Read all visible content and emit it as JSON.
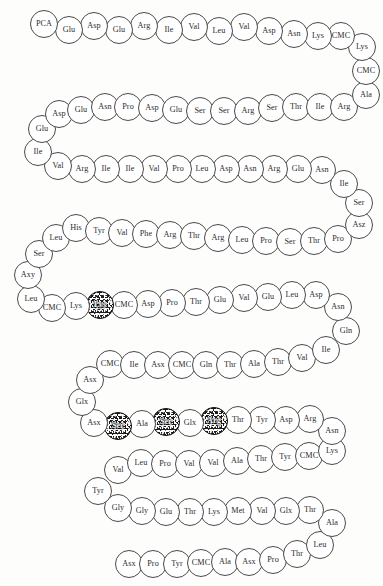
{
  "figure": {
    "caption": "",
    "width": 383,
    "height": 586,
    "circle_diameter": 28,
    "colors": {
      "background": "#fdfdfc",
      "circle_fill": "#ffffff",
      "circle_stroke": "#4a4a4a",
      "modified_fill": "#1c1c1c",
      "text": "#2b2b2b",
      "modified_text": "#ffffff"
    }
  },
  "legend": {
    "modified_meaning": "shaded residue"
  },
  "chart_data": {
    "type": "diagram",
    "title": "",
    "layout": "boustrophedon",
    "modified_positions": [
      59,
      117,
      119,
      121
    ],
    "residues": [
      {
        "i": 1,
        "label": "PCA",
        "x": 30,
        "y": 10,
        "modified": false
      },
      {
        "i": 2,
        "label": "Glu",
        "x": 55,
        "y": 16,
        "modified": false
      },
      {
        "i": 3,
        "label": "Asp",
        "x": 80,
        "y": 12,
        "modified": false
      },
      {
        "i": 4,
        "label": "Glu",
        "x": 105,
        "y": 16,
        "modified": false
      },
      {
        "i": 5,
        "label": "Arg",
        "x": 130,
        "y": 12,
        "modified": false
      },
      {
        "i": 6,
        "label": "Ile",
        "x": 155,
        "y": 16,
        "modified": false
      },
      {
        "i": 7,
        "label": "Val",
        "x": 180,
        "y": 13,
        "modified": false
      },
      {
        "i": 8,
        "label": "Leu",
        "x": 205,
        "y": 17,
        "modified": false
      },
      {
        "i": 9,
        "label": "Val",
        "x": 230,
        "y": 13,
        "modified": false
      },
      {
        "i": 10,
        "label": "Asp",
        "x": 255,
        "y": 17,
        "modified": false
      },
      {
        "i": 11,
        "label": "Asn",
        "x": 280,
        "y": 20,
        "modified": false
      },
      {
        "i": 12,
        "label": "Lys",
        "x": 304,
        "y": 22,
        "modified": false
      },
      {
        "i": 13,
        "label": "CMC",
        "x": 327,
        "y": 22,
        "modified": false
      },
      {
        "i": 14,
        "label": "Lys",
        "x": 348,
        "y": 33,
        "modified": false
      },
      {
        "i": 15,
        "label": "CMC",
        "x": 352,
        "y": 57,
        "modified": false
      },
      {
        "i": 16,
        "label": "Ala",
        "x": 352,
        "y": 81,
        "modified": false
      },
      {
        "i": 17,
        "label": "Arg",
        "x": 330,
        "y": 93,
        "modified": false
      },
      {
        "i": 18,
        "label": "Ile",
        "x": 306,
        "y": 93,
        "modified": false
      },
      {
        "i": 19,
        "label": "Thr",
        "x": 282,
        "y": 93,
        "modified": false
      },
      {
        "i": 20,
        "label": "Ser",
        "x": 258,
        "y": 94,
        "modified": false
      },
      {
        "i": 21,
        "label": "Arg",
        "x": 234,
        "y": 97,
        "modified": false
      },
      {
        "i": 22,
        "label": "Ser",
        "x": 210,
        "y": 97,
        "modified": false
      },
      {
        "i": 23,
        "label": "Ser",
        "x": 186,
        "y": 97,
        "modified": false
      },
      {
        "i": 24,
        "label": "Glu",
        "x": 162,
        "y": 96,
        "modified": false
      },
      {
        "i": 25,
        "label": "Asp",
        "x": 138,
        "y": 94,
        "modified": false
      },
      {
        "i": 26,
        "label": "Pro",
        "x": 114,
        "y": 93,
        "modified": false
      },
      {
        "i": 27,
        "label": "Asn",
        "x": 91,
        "y": 93,
        "modified": false
      },
      {
        "i": 28,
        "label": "Glu",
        "x": 67,
        "y": 96,
        "modified": false
      },
      {
        "i": 29,
        "label": "Asp",
        "x": 45,
        "y": 100,
        "modified": false
      },
      {
        "i": 30,
        "label": "Glu",
        "x": 28,
        "y": 115,
        "modified": false
      },
      {
        "i": 31,
        "label": "Ile",
        "x": 24,
        "y": 138,
        "modified": false
      },
      {
        "i": 32,
        "label": "Val",
        "x": 44,
        "y": 152,
        "modified": false
      },
      {
        "i": 33,
        "label": "Arg",
        "x": 68,
        "y": 155,
        "modified": false
      },
      {
        "i": 34,
        "label": "Ile",
        "x": 92,
        "y": 155,
        "modified": false
      },
      {
        "i": 35,
        "label": "Ile",
        "x": 116,
        "y": 155,
        "modified": false
      },
      {
        "i": 36,
        "label": "Val",
        "x": 140,
        "y": 155,
        "modified": false
      },
      {
        "i": 37,
        "label": "Pro",
        "x": 164,
        "y": 155,
        "modified": false
      },
      {
        "i": 38,
        "label": "Leu",
        "x": 188,
        "y": 155,
        "modified": false
      },
      {
        "i": 39,
        "label": "Asp",
        "x": 212,
        "y": 155,
        "modified": false
      },
      {
        "i": 40,
        "label": "Asn",
        "x": 236,
        "y": 155,
        "modified": false
      },
      {
        "i": 41,
        "label": "Arg",
        "x": 260,
        "y": 155,
        "modified": false
      },
      {
        "i": 42,
        "label": "Glu",
        "x": 284,
        "y": 155,
        "modified": false
      },
      {
        "i": 43,
        "label": "Asn",
        "x": 308,
        "y": 156,
        "modified": false
      },
      {
        "i": 44,
        "label": "Ile",
        "x": 330,
        "y": 170,
        "modified": false
      },
      {
        "i": 45,
        "label": "Ser",
        "x": 345,
        "y": 189,
        "modified": false
      },
      {
        "i": 46,
        "label": "Asz",
        "x": 345,
        "y": 211,
        "modified": false
      },
      {
        "i": 47,
        "label": "Pro",
        "x": 324,
        "y": 225,
        "modified": false
      },
      {
        "i": 48,
        "label": "Thr",
        "x": 300,
        "y": 227,
        "modified": false
      },
      {
        "i": 49,
        "label": "Ser",
        "x": 276,
        "y": 228,
        "modified": false
      },
      {
        "i": 50,
        "label": "Pro",
        "x": 252,
        "y": 227,
        "modified": false
      },
      {
        "i": 51,
        "label": "Leu",
        "x": 228,
        "y": 226,
        "modified": false
      },
      {
        "i": 52,
        "label": "Arg",
        "x": 204,
        "y": 224,
        "modified": false
      },
      {
        "i": 53,
        "label": "Thr",
        "x": 180,
        "y": 222,
        "modified": false
      },
      {
        "i": 54,
        "label": "Arg",
        "x": 156,
        "y": 221,
        "modified": false
      },
      {
        "i": 55,
        "label": "Phe",
        "x": 132,
        "y": 220,
        "modified": false
      },
      {
        "i": 56,
        "label": "Val",
        "x": 108,
        "y": 219,
        "modified": false
      },
      {
        "i": 57,
        "label": "Tyr",
        "x": 85,
        "y": 217,
        "modified": false
      },
      {
        "i": 58,
        "label": "His",
        "x": 62,
        "y": 214,
        "modified": false
      },
      {
        "i": 59,
        "label": "Leu",
        "x": 42,
        "y": 224,
        "modified": false
      },
      {
        "i": 60,
        "label": "Ser",
        "x": 25,
        "y": 240,
        "modified": false
      },
      {
        "i": 61,
        "label": "Axy",
        "x": 14,
        "y": 261,
        "modified": false
      },
      {
        "i": 62,
        "label": "Leu",
        "x": 17,
        "y": 285,
        "modified": false
      },
      {
        "i": 63,
        "label": "CMC",
        "x": 38,
        "y": 294,
        "modified": false
      },
      {
        "i": 64,
        "label": "Lys",
        "x": 62,
        "y": 292,
        "modified": false
      },
      {
        "i": 65,
        "label": "Lys",
        "x": 86,
        "y": 291,
        "modified": true
      },
      {
        "i": 66,
        "label": "CMC",
        "x": 110,
        "y": 291,
        "modified": false
      },
      {
        "i": 67,
        "label": "Asp",
        "x": 134,
        "y": 290,
        "modified": false
      },
      {
        "i": 68,
        "label": "Pro",
        "x": 158,
        "y": 289,
        "modified": false
      },
      {
        "i": 69,
        "label": "Thr",
        "x": 182,
        "y": 288,
        "modified": false
      },
      {
        "i": 70,
        "label": "Glu",
        "x": 206,
        "y": 286,
        "modified": false
      },
      {
        "i": 71,
        "label": "Val",
        "x": 230,
        "y": 284,
        "modified": false
      },
      {
        "i": 72,
        "label": "Glu",
        "x": 254,
        "y": 283,
        "modified": false
      },
      {
        "i": 73,
        "label": "Leu",
        "x": 278,
        "y": 281,
        "modified": false
      },
      {
        "i": 74,
        "label": "Asp",
        "x": 302,
        "y": 281,
        "modified": false
      },
      {
        "i": 75,
        "label": "Asn",
        "x": 324,
        "y": 293,
        "modified": false
      },
      {
        "i": 76,
        "label": "Gln",
        "x": 332,
        "y": 317,
        "modified": false
      },
      {
        "i": 77,
        "label": "Ile",
        "x": 312,
        "y": 336,
        "modified": false
      },
      {
        "i": 78,
        "label": "Val",
        "x": 288,
        "y": 344,
        "modified": false
      },
      {
        "i": 79,
        "label": "Thr",
        "x": 264,
        "y": 348,
        "modified": false
      },
      {
        "i": 80,
        "label": "Ala",
        "x": 240,
        "y": 350,
        "modified": false
      },
      {
        "i": 81,
        "label": "Thr",
        "x": 216,
        "y": 351,
        "modified": false
      },
      {
        "i": 82,
        "label": "Gln",
        "x": 192,
        "y": 351,
        "modified": false
      },
      {
        "i": 83,
        "label": "CMC",
        "x": 168,
        "y": 351,
        "modified": false
      },
      {
        "i": 84,
        "label": "Asx",
        "x": 144,
        "y": 351,
        "modified": false
      },
      {
        "i": 85,
        "label": "Ile",
        "x": 120,
        "y": 351,
        "modified": false
      },
      {
        "i": 86,
        "label": "CMC",
        "x": 96,
        "y": 350,
        "modified": false
      },
      {
        "i": 87,
        "label": "Asx",
        "x": 76,
        "y": 366,
        "modified": false
      },
      {
        "i": 88,
        "label": "Glx",
        "x": 68,
        "y": 388,
        "modified": false
      },
      {
        "i": 89,
        "label": "Asx",
        "x": 80,
        "y": 409,
        "modified": false
      },
      {
        "i": 90,
        "label": "Ser",
        "x": 104,
        "y": 412,
        "modified": true
      },
      {
        "i": 91,
        "label": "Ala",
        "x": 128,
        "y": 410,
        "modified": false
      },
      {
        "i": 92,
        "label": "Ser",
        "x": 152,
        "y": 408,
        "modified": true
      },
      {
        "i": 93,
        "label": "Glx",
        "x": 176,
        "y": 409,
        "modified": false
      },
      {
        "i": 94,
        "label": "Arg",
        "x": 200,
        "y": 407,
        "modified": true
      },
      {
        "i": 95,
        "label": "Thr",
        "x": 224,
        "y": 406,
        "modified": false
      },
      {
        "i": 96,
        "label": "Tyr",
        "x": 248,
        "y": 406,
        "modified": false
      },
      {
        "i": 97,
        "label": "Asp",
        "x": 272,
        "y": 406,
        "modified": false
      },
      {
        "i": 98,
        "label": "Arg",
        "x": 296,
        "y": 405,
        "modified": false
      },
      {
        "i": 99,
        "label": "Asn",
        "x": 318,
        "y": 417,
        "modified": false
      },
      {
        "i": 100,
        "label": "Lys",
        "x": 318,
        "y": 437,
        "modified": false
      },
      {
        "i": 101,
        "label": "CMC",
        "x": 295,
        "y": 442,
        "modified": false
      },
      {
        "i": 102,
        "label": "Tyr",
        "x": 271,
        "y": 443,
        "modified": false
      },
      {
        "i": 103,
        "label": "Thr",
        "x": 247,
        "y": 445,
        "modified": false
      },
      {
        "i": 104,
        "label": "Ala",
        "x": 223,
        "y": 447,
        "modified": false
      },
      {
        "i": 105,
        "label": "Val",
        "x": 199,
        "y": 449,
        "modified": false
      },
      {
        "i": 106,
        "label": "Val",
        "x": 175,
        "y": 450,
        "modified": false
      },
      {
        "i": 107,
        "label": "Pro",
        "x": 151,
        "y": 450,
        "modified": false
      },
      {
        "i": 108,
        "label": "Leu",
        "x": 127,
        "y": 449,
        "modified": false
      },
      {
        "i": 109,
        "label": "Val",
        "x": 104,
        "y": 456,
        "modified": false
      },
      {
        "i": 110,
        "label": "Tyr",
        "x": 84,
        "y": 477,
        "modified": false
      },
      {
        "i": 111,
        "label": "Gly",
        "x": 104,
        "y": 494,
        "modified": false
      },
      {
        "i": 112,
        "label": "Gly",
        "x": 128,
        "y": 497,
        "modified": false
      },
      {
        "i": 113,
        "label": "Glu",
        "x": 152,
        "y": 498,
        "modified": false
      },
      {
        "i": 114,
        "label": "Thr",
        "x": 176,
        "y": 498,
        "modified": false
      },
      {
        "i": 115,
        "label": "Lys",
        "x": 200,
        "y": 498,
        "modified": false
      },
      {
        "i": 116,
        "label": "Met",
        "x": 224,
        "y": 497,
        "modified": false
      },
      {
        "i": 117,
        "label": "Val",
        "x": 248,
        "y": 497,
        "modified": false
      },
      {
        "i": 118,
        "label": "Glx",
        "x": 272,
        "y": 497,
        "modified": false
      },
      {
        "i": 119,
        "label": "Thr",
        "x": 296,
        "y": 496,
        "modified": false
      },
      {
        "i": 120,
        "label": "Ala",
        "x": 318,
        "y": 509,
        "modified": false
      },
      {
        "i": 121,
        "label": "Leu",
        "x": 306,
        "y": 531,
        "modified": false
      },
      {
        "i": 122,
        "label": "Thr",
        "x": 283,
        "y": 540,
        "modified": false
      },
      {
        "i": 123,
        "label": "Pro",
        "x": 259,
        "y": 546,
        "modified": false
      },
      {
        "i": 124,
        "label": "Asx",
        "x": 235,
        "y": 548,
        "modified": false
      },
      {
        "i": 125,
        "label": "Ala",
        "x": 211,
        "y": 548,
        "modified": false
      },
      {
        "i": 126,
        "label": "CMC",
        "x": 187,
        "y": 549,
        "modified": false
      },
      {
        "i": 127,
        "label": "Tyr",
        "x": 163,
        "y": 550,
        "modified": false
      },
      {
        "i": 128,
        "label": "Pro",
        "x": 139,
        "y": 550,
        "modified": false
      },
      {
        "i": 129,
        "label": "Asx",
        "x": 115,
        "y": 550,
        "modified": false
      }
    ]
  }
}
